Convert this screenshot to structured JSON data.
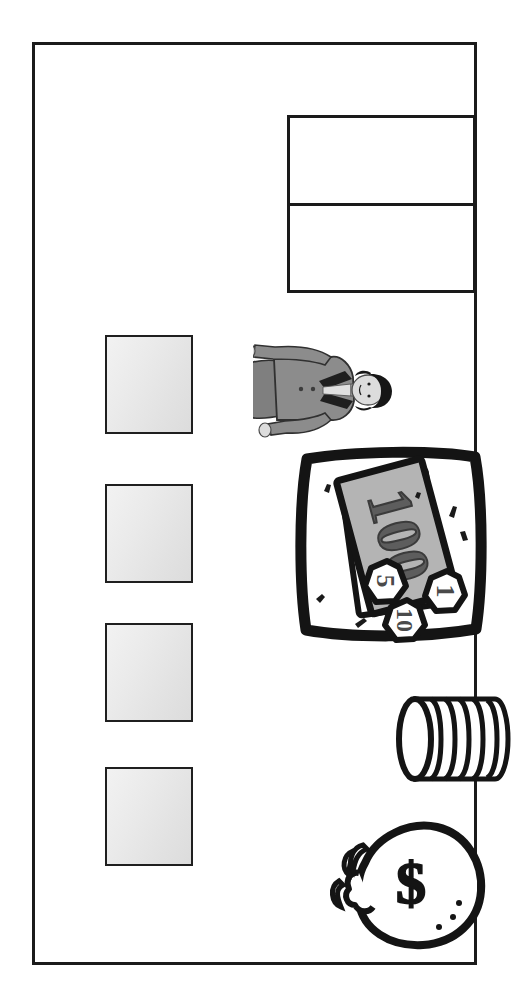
{
  "page": {
    "background_color": "#ffffff",
    "frame": {
      "name": "slide-border",
      "border_color": "#1b1b1b"
    }
  },
  "content_table": {
    "name": "content-table",
    "border_color": "#1a1a1a",
    "rows": [
      {
        "cell_text": ""
      },
      {
        "cell_text": ""
      }
    ]
  },
  "placeholder_boxes": [
    {
      "label": "",
      "fill_from": "#f2f2f2",
      "fill_to": "#dcdcdc",
      "border_color": "#1f1f1f"
    },
    {
      "label": "",
      "fill_from": "#f2f2f2",
      "fill_to": "#dcdcdc",
      "border_color": "#1f1f1f"
    },
    {
      "label": "",
      "fill_from": "#f2f2f2",
      "fill_to": "#dcdcdc",
      "border_color": "#1f1f1f"
    },
    {
      "label": "",
      "fill_from": "#f2f2f2",
      "fill_to": "#dcdcdc",
      "border_color": "#1f1f1f"
    }
  ],
  "clipart": {
    "businessperson": {
      "name": "businessperson-clipart",
      "description": "businesswoman in suit holding a briefcase",
      "rotation_degrees": 90,
      "suit_color": "#8a8a8a",
      "hair_color": "#1d1d1d",
      "skin_color": "#d8d8d8"
    },
    "cash": {
      "name": "cash-and-coins-clipart",
      "description": "banknote with coins",
      "rotation_degrees": 90,
      "banknote_denomination": "100",
      "coin_denominations": [
        "1",
        "10",
        "5"
      ],
      "note_fill": "#b4b4b4",
      "outline_color": "#141414"
    },
    "coin_stack": {
      "name": "coin-stack-clipart",
      "description": "stack of coins on its side",
      "rotation_degrees": 90,
      "coin_count": 6,
      "outline_color": "#141414"
    },
    "money_bag": {
      "name": "money-bag-clipart",
      "description": "tied money bag marked with a dollar sign",
      "symbol": "$",
      "outline_color": "#141414"
    }
  }
}
